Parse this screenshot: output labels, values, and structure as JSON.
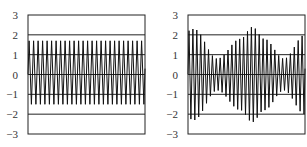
{
  "chart_data": [
    {
      "type": "line",
      "title": "",
      "xlabel": "",
      "ylabel": "",
      "ylim": [
        -3,
        3
      ],
      "yticks": [
        "3",
        "2",
        "1",
        "0",
        "−1",
        "−2",
        "−3"
      ],
      "ytick_values": [
        3,
        2,
        1,
        0,
        -1,
        -2,
        -3
      ],
      "grid": "horizontal at each integer",
      "legend": "none",
      "series": [
        {
          "name": "constant-amplitude oscillation",
          "cycles": 26,
          "max": 1.7,
          "min": -1.5,
          "description": "Uniform high-frequency oscillation between about -1.5 and 1.7"
        }
      ]
    },
    {
      "type": "line",
      "title": "",
      "xlabel": "",
      "ylabel": "",
      "ylim": [
        -3,
        3
      ],
      "yticks": [
        "3",
        "2",
        "1",
        "0",
        "−1",
        "−2",
        "−3"
      ],
      "ytick_values": [
        3,
        2,
        1,
        0,
        -1,
        -2,
        -3
      ],
      "grid": "horizontal at each integer",
      "legend": "none",
      "series": [
        {
          "name": "amplitude-modulated oscillation",
          "cycles": 30,
          "envelope_x": [
            0.0,
            0.05,
            0.25,
            0.45,
            0.55,
            0.65,
            0.82,
            1.0
          ],
          "envelope_amp": [
            2.2,
            2.3,
            0.8,
            1.8,
            2.4,
            1.8,
            0.8,
            2.0
          ],
          "description": "Beat pattern: amplitude large at start, minimum ~0.8 near 25%, peak ~2.4 near 55%, minimum ~0.8 near 82%, rising again at end"
        }
      ]
    }
  ]
}
